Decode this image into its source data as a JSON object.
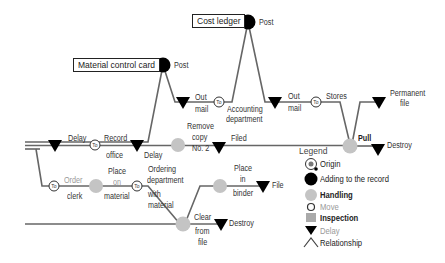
{
  "diagram": {
    "type": "flow-process-chart",
    "colors": {
      "line": "#666666",
      "add_to_record": "#000000",
      "handling": "#c4c4c4",
      "delay": "#000000",
      "box_border": "#222222"
    },
    "records": {
      "material_control_card": "Material control card",
      "cost_ledger": "Cost ledger"
    },
    "labels": {
      "post_1": "Post",
      "post_2": "Post",
      "delay_1": "Delay",
      "record_office_1": "Record",
      "record_office_2": "office",
      "delay_2": "Delay",
      "out_mail_1a": "Out",
      "out_mail_1b": "mail",
      "accounting_1": "Accounting",
      "accounting_2": "department",
      "out_mail_2a": "Out",
      "out_mail_2b": "mail",
      "stores": "Stores",
      "permanent_1": "Permanent",
      "permanent_2": "file",
      "remove_1": "Remove",
      "remove_2": "copy",
      "remove_3": "No. 2",
      "filed": "Filed",
      "pull": "Pull",
      "destroy_1": "Destroy",
      "order_1": "Order",
      "order_2": "clerk",
      "place_on_1": "Place",
      "place_on_2": "on",
      "place_on_3": "material",
      "ordering_1": "Ordering",
      "ordering_2": "department",
      "ordering_3": "with",
      "ordering_4": "material",
      "place_in_1": "Place",
      "place_in_2": "in",
      "place_in_3": "binder",
      "file": "File",
      "clear_1": "Clear",
      "clear_2": "from",
      "clear_3": "file",
      "destroy_2": "Destroy",
      "to": "To"
    },
    "legend": {
      "title": "Legend",
      "items": [
        {
          "symbol": "origin",
          "label": "Origin"
        },
        {
          "symbol": "add-to-record",
          "label": "Adding to the record"
        },
        {
          "symbol": "handling",
          "label": "Handling"
        },
        {
          "symbol": "move",
          "label": "Move"
        },
        {
          "symbol": "inspection",
          "label": "Inspection"
        },
        {
          "symbol": "delay",
          "label": "Delay"
        },
        {
          "symbol": "relationship",
          "label": "Relationship"
        }
      ]
    }
  }
}
